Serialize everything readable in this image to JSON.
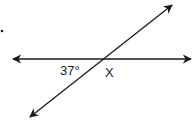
{
  "diagram": {
    "type": "intersecting-lines",
    "line_color": "#1a1a1a",
    "labels": {
      "known_angle": "37°",
      "unknown_angle": "X"
    },
    "horizontal_line": {
      "x1": 13,
      "y1": 59,
      "x2": 191,
      "y2": 59,
      "arrows": "both"
    },
    "diagonal_line": {
      "x1": 30,
      "y1": 117,
      "x2": 172,
      "y2": 5,
      "arrows": "both"
    },
    "intersection": {
      "x": 104,
      "y": 59
    },
    "bullet_dot": {
      "x": 2,
      "y": 31
    }
  }
}
